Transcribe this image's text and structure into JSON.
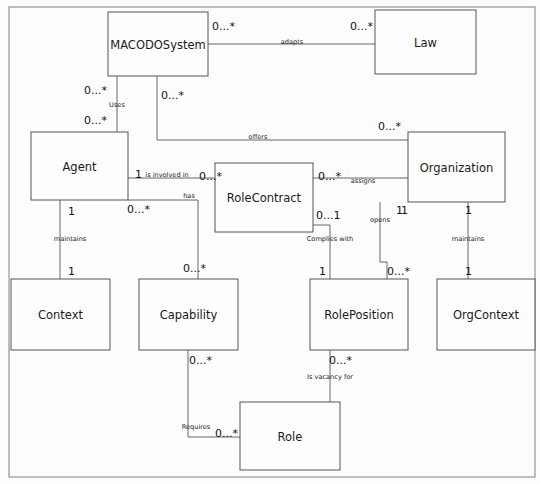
{
  "diagram": {
    "type": "uml-class-diagram",
    "frame": {
      "x": 9,
      "y": 7,
      "width": 526,
      "height": 470
    },
    "colors": {
      "box_fill": "#fefefe",
      "box_stroke": "#555555",
      "line": "#666666",
      "text": "#1a1a1a",
      "background": "#fdfdfd"
    },
    "classes": [
      {
        "id": "macodosystem",
        "label": "MACODOSystem",
        "x": 108,
        "y": 12,
        "w": 100,
        "h": 64
      },
      {
        "id": "law",
        "label": "Law",
        "x": 375,
        "y": 10,
        "w": 101,
        "h": 64
      },
      {
        "id": "agent",
        "label": "Agent",
        "x": 31,
        "y": 132,
        "w": 97,
        "h": 68
      },
      {
        "id": "rolecontract",
        "label": "RoleContract",
        "x": 215,
        "y": 163,
        "w": 98,
        "h": 69
      },
      {
        "id": "organization",
        "label": "Organization",
        "x": 408,
        "y": 132,
        "w": 97,
        "h": 70
      },
      {
        "id": "context",
        "label": "Context",
        "x": 11,
        "y": 279,
        "w": 99,
        "h": 71
      },
      {
        "id": "capability",
        "label": "Capability",
        "x": 139,
        "y": 279,
        "w": 99,
        "h": 71
      },
      {
        "id": "roleposition",
        "label": "RolePosition",
        "x": 310,
        "y": 279,
        "w": 98,
        "h": 71
      },
      {
        "id": "orgcontext",
        "label": "OrgContext",
        "x": 437,
        "y": 279,
        "w": 98,
        "h": 71
      },
      {
        "id": "role",
        "label": "Role",
        "x": 240,
        "y": 402,
        "w": 100,
        "h": 68
      }
    ],
    "associations": [
      {
        "id": "adapts",
        "label": "adapts",
        "from": "macodosystem",
        "to": "law",
        "label_x": 292,
        "label_y": 44
      },
      {
        "id": "uses",
        "label": "Uses",
        "from": "macodosystem",
        "to": "agent",
        "label_x": 117,
        "label_y": 107
      },
      {
        "id": "offers",
        "label": "offers",
        "from": "macodosystem",
        "to": "organization",
        "label_x": 258,
        "label_y": 139
      },
      {
        "id": "is-involved-in",
        "label": "is involved in",
        "from": "agent",
        "to": "rolecontract",
        "label_x": 167,
        "label_y": 177
      },
      {
        "id": "assigns",
        "label": "assigns",
        "from": "rolecontract",
        "to": "organization",
        "label_x": 363,
        "label_y": 183
      },
      {
        "id": "has",
        "label": "has",
        "from": "agent",
        "to": "capability",
        "label_x": 189,
        "label_y": 198
      },
      {
        "id": "maintains-1",
        "label": "maintains",
        "from": "agent",
        "to": "context",
        "label_x": 70,
        "label_y": 241
      },
      {
        "id": "complies-with",
        "label": "Complies with",
        "from": "rolecontract",
        "to": "roleposition",
        "label_x": 330,
        "label_y": 241
      },
      {
        "id": "opens",
        "label": "opens",
        "from": "organization",
        "to": "roleposition",
        "label_x": 380,
        "label_y": 222
      },
      {
        "id": "maintains-2",
        "label": "maintains",
        "from": "organization",
        "to": "orgcontext",
        "label_x": 468,
        "label_y": 241
      },
      {
        "id": "is-vacancy-for",
        "label": "Is vacancy for",
        "from": "roleposition",
        "to": "role",
        "label_x": 330,
        "label_y": 379
      },
      {
        "id": "requires",
        "label": "Requires",
        "from": "capability",
        "to": "role",
        "label_x": 196,
        "label_y": 429
      }
    ],
    "multiplicities": [
      {
        "id": "m-adapts-src",
        "text": "0...*",
        "x": 212,
        "y": 30,
        "assoc": "adapts"
      },
      {
        "id": "m-adapts-dst",
        "text": "0...*",
        "x": 350,
        "y": 30,
        "assoc": "adapts"
      },
      {
        "id": "m-uses-src",
        "text": "0...*",
        "x": 84,
        "y": 94,
        "assoc": "uses"
      },
      {
        "id": "m-uses-dst",
        "text": "0...*",
        "x": 84,
        "y": 124,
        "assoc": "uses"
      },
      {
        "id": "m-offers-src",
        "text": "0...*",
        "x": 161,
        "y": 99,
        "assoc": "offers"
      },
      {
        "id": "m-offers-dst",
        "text": "0...*",
        "x": 378,
        "y": 130,
        "assoc": "offers"
      },
      {
        "id": "m-involved-src",
        "text": "1",
        "x": 135,
        "y": 178,
        "assoc": "is-involved-in"
      },
      {
        "id": "m-involved-dst",
        "text": "0...*",
        "x": 199,
        "y": 180,
        "assoc": "is-involved-in"
      },
      {
        "id": "m-assigns-src",
        "text": "0...*",
        "x": 318,
        "y": 180,
        "assoc": "assigns"
      },
      {
        "id": "m-assigns-dst",
        "text": "1",
        "x": 401,
        "y": 214,
        "assoc": "assigns"
      },
      {
        "id": "m-has-src",
        "text": "0...*",
        "x": 127,
        "y": 213,
        "assoc": "has"
      },
      {
        "id": "m-has-dst",
        "text": "0...*",
        "x": 183,
        "y": 272,
        "assoc": "has"
      },
      {
        "id": "m-maint1-src",
        "text": "1",
        "x": 68,
        "y": 215,
        "assoc": "maintains-1"
      },
      {
        "id": "m-maint1-dst",
        "text": "1",
        "x": 68,
        "y": 275,
        "assoc": "maintains-1"
      },
      {
        "id": "m-complies-src",
        "text": "0...1",
        "x": 316,
        "y": 219,
        "assoc": "complies-with"
      },
      {
        "id": "m-complies-dst",
        "text": "1",
        "x": 319,
        "y": 275,
        "assoc": "complies-with"
      },
      {
        "id": "m-opens-src",
        "text": "1",
        "x": 396,
        "y": 214,
        "assoc": "opens"
      },
      {
        "id": "m-opens-dst",
        "text": "0...*",
        "x": 387,
        "y": 275,
        "assoc": "opens"
      },
      {
        "id": "m-maint2-src",
        "text": "1",
        "x": 465,
        "y": 214,
        "assoc": "maintains-2"
      },
      {
        "id": "m-maint2-dst",
        "text": "1",
        "x": 465,
        "y": 275,
        "assoc": "maintains-2"
      },
      {
        "id": "m-vacancy-src",
        "text": "0...*",
        "x": 329,
        "y": 364,
        "assoc": "is-vacancy-for"
      },
      {
        "id": "m-requires-src",
        "text": "0...*",
        "x": 189,
        "y": 364,
        "assoc": "requires"
      },
      {
        "id": "m-requires-dst",
        "text": "0...*",
        "x": 215,
        "y": 437,
        "assoc": "requires"
      }
    ],
    "edges": [
      {
        "id": "e-adapts",
        "d": "M 208 44 L 375 44"
      },
      {
        "id": "e-uses",
        "d": "M 117 76 L 117 132"
      },
      {
        "id": "e-offers",
        "d": "M 157 76 L 157 140 L 408 140"
      },
      {
        "id": "e-involved",
        "d": "M 128 178 L 215 178"
      },
      {
        "id": "e-assigns",
        "d": "M 313 178 L 408 178"
      },
      {
        "id": "e-has",
        "d": "M 128 200 L 198 200 L 198 279"
      },
      {
        "id": "e-maintains-1",
        "d": "M 60 200 L 60 279"
      },
      {
        "id": "e-complies",
        "d": "M 313 225 L 330 225 L 330 279"
      },
      {
        "id": "e-opens",
        "d": "M 380 202 L 380 262 L 387 262 L 387 279"
      },
      {
        "id": "e-maintains-2",
        "d": "M 468 202 L 468 279"
      },
      {
        "id": "e-vacancy",
        "d": "M 330 350 L 330 402"
      },
      {
        "id": "e-requires",
        "d": "M 188 350 L 188 437 L 240 437"
      }
    ]
  }
}
